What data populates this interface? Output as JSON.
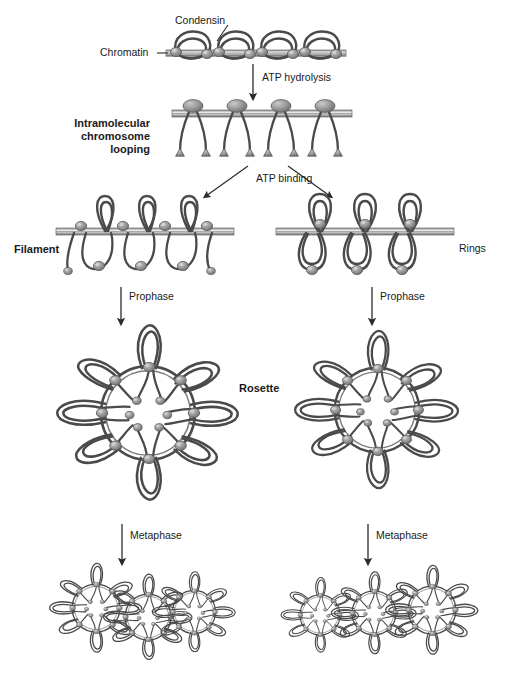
{
  "figure": {
    "background_color": "#ffffff",
    "ink_color": "#3f3f3f",
    "bead_color": "#8c8c8c",
    "text_color": "#1a1a1a"
  },
  "labels": {
    "condensin": "Condensin",
    "chromatin": "Chromatin",
    "atp_hydrolysis": "ATP hydrolysis",
    "intramolecular_looping": "Intramolecular\nchromosome\nlooping",
    "atp_binding": "ATP binding",
    "filament": "Filament",
    "rings": "Rings",
    "prophase_left": "Prophase",
    "prophase_right": "Prophase",
    "rosette": "Rosette",
    "metaphase_left": "Metaphase",
    "metaphase_right": "Metaphase"
  },
  "stages": [
    {
      "id": "chromatin-fiber",
      "name": "Chromatin with condensin",
      "row": 1,
      "units": 4,
      "description": "Linear chromatin fiber with four condensin-bound loops"
    },
    {
      "id": "looping-fiber",
      "name": "Intramolecular chromosome looping",
      "row": 2,
      "units": 4,
      "description": "Condensed fiber with condensin heads above and paired dangling legs below"
    },
    {
      "id": "filament",
      "name": "Filament",
      "row": 3,
      "branch": "left",
      "units": 3,
      "description": "Fiber with alternating upper loops and lower loops, condensin along the axis"
    },
    {
      "id": "rings",
      "name": "Rings",
      "row": 3,
      "branch": "right",
      "units": 3,
      "description": "Fiber with paired upper and lower rings joined at condensin nodes"
    },
    {
      "id": "rosette-left",
      "name": "Rosette",
      "row": 4,
      "branch": "left",
      "outer_loops": 8,
      "spokes": 8,
      "description": "Radial rosette: central condensin core, ring, eight radiating loops"
    },
    {
      "id": "rosette-right",
      "name": "Rosette",
      "row": 4,
      "branch": "right",
      "outer_loops": 8,
      "spokes": 8,
      "description": "Radial rosette formed from the rings pathway"
    },
    {
      "id": "metaphase-left",
      "name": "Metaphase chromatid",
      "row": 5,
      "branch": "left",
      "rosettes": 3,
      "description": "Three stacked rosettes forming a metaphase chromatid"
    },
    {
      "id": "metaphase-right",
      "name": "Metaphase chromatid",
      "row": 5,
      "branch": "right",
      "rosettes": 3,
      "description": "Three stacked rosettes forming a metaphase chromatid"
    }
  ],
  "arrows": [
    {
      "id": "atp-hydrolysis-arrow",
      "label": "ATP hydrolysis",
      "direction": "down"
    },
    {
      "id": "atp-binding-arrow-left",
      "label": "ATP binding",
      "direction": "down-left"
    },
    {
      "id": "atp-binding-arrow-right",
      "label": "ATP binding",
      "direction": "down-right"
    },
    {
      "id": "prophase-arrow-left",
      "label": "Prophase",
      "direction": "down"
    },
    {
      "id": "prophase-arrow-right",
      "label": "Prophase",
      "direction": "down"
    },
    {
      "id": "metaphase-arrow-left",
      "label": "Metaphase",
      "direction": "down"
    },
    {
      "id": "metaphase-arrow-right",
      "label": "Metaphase",
      "direction": "down"
    }
  ]
}
